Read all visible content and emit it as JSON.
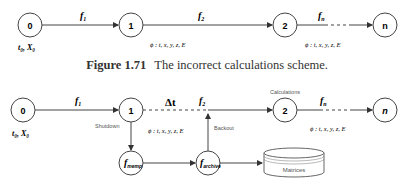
{
  "diagram_top": {
    "nodes": [
      "0",
      "1",
      "2",
      "n"
    ],
    "edges": [
      {
        "from": "0",
        "to": "1",
        "label": "f",
        "sub": "1"
      },
      {
        "from": "1",
        "to": "2",
        "label": "f",
        "sub": "2"
      },
      {
        "from": "2",
        "to": "n",
        "label": "f",
        "sub": "n",
        "dashed": true
      }
    ],
    "initial_label": "t₀, X₀",
    "phi_label_1": "ϕ : t, x, y, z, E",
    "phi_label_2": "ϕ : t, x, y, z, E",
    "phi_sub": "ω"
  },
  "caption": {
    "number": "Figure 1.71",
    "text": "The incorrect calculations scheme."
  },
  "diagram_bottom": {
    "nodes": [
      "0",
      "1",
      "2",
      "n"
    ],
    "edge_labels": {
      "f1": "1",
      "f2": "2",
      "fn": "n"
    },
    "delta_t": "Δt",
    "initial_label": "t₀, X₀",
    "shutdown_label": "Shutdown",
    "backout_label": "Backout",
    "calculations_label": "Calculations",
    "phi_label_1": "ϕ : t, x, y, z, E",
    "phi_label_2": "ϕ : t, x, y, z, E",
    "memp_node_sub": "memp",
    "backup_node_sub": "archive",
    "matrices_label": "Matrices"
  }
}
